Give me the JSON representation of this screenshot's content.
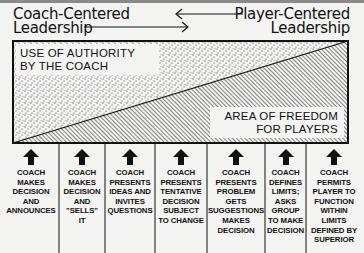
{
  "header": {
    "left_title": [
      "Coach-Centered",
      "Leadership"
    ],
    "right_title": [
      "Player-Centered",
      "Leadership"
    ]
  },
  "panel": {
    "authority_label": [
      "USE OF AUTHORITY",
      "BY THE COACH"
    ],
    "freedom_label": [
      "AREA OF FREEDOM",
      "FOR PLAYERS"
    ]
  },
  "columns": [
    {
      "lines": [
        "COACH",
        "MAKES",
        "DECISION",
        "AND",
        "ANNOUNCES"
      ]
    },
    {
      "lines": [
        "COACH",
        "MAKES",
        "DECISION",
        "AND",
        "\"SELLS\"",
        "IT"
      ]
    },
    {
      "lines": [
        "COACH",
        "PRESENTS",
        "IDEAS AND",
        "INVITES",
        "QUESTIONS"
      ]
    },
    {
      "lines": [
        "COACH",
        "PRESENTS",
        "TENTATIVE",
        "DECISION",
        "SUBJECT",
        "TO CHANGE"
      ]
    },
    {
      "lines": [
        "COACH",
        "PRESENTS",
        "PROBLEM",
        "GETS",
        "SUGGESTIONS",
        "MAKES",
        "DECISION"
      ]
    },
    {
      "lines": [
        "COACH",
        "DEFINES",
        "LIMITS;",
        "ASKS",
        "GROUP",
        "TO MAKE",
        "DECISION"
      ]
    },
    {
      "lines": [
        "COACH",
        "PERMITS",
        "PLAYER TO",
        "FUNCTION",
        "WITHIN",
        "LIMITS",
        "DEFINED BY",
        "SUPERIOR"
      ]
    }
  ],
  "colors": {
    "ink": "#111111",
    "paper": "#f4f4f2",
    "topbar": "#8a8a8a"
  }
}
